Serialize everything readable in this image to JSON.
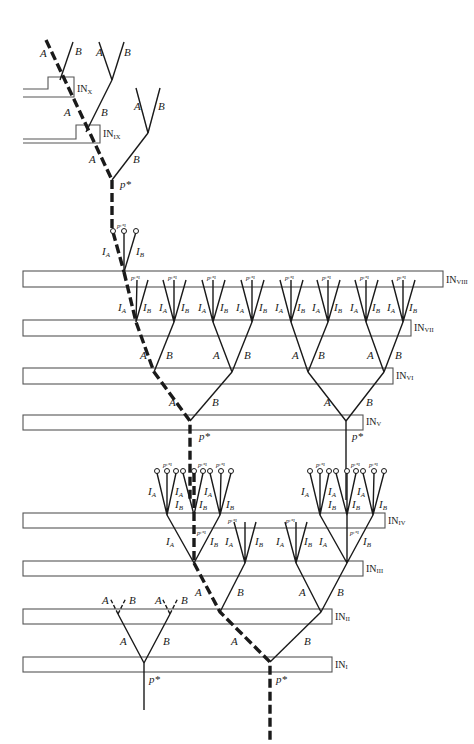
{
  "diagram": {
    "type": "branching-tree-with-interaction-zones",
    "path_style": {
      "highlighted_path": "dashed-thick",
      "other": "solid-thin"
    },
    "branch_labels": {
      "a": "A",
      "b": "B",
      "ia": "I",
      "ia_sub": "A",
      "ib": "I",
      "ib_sub": "B"
    },
    "node_labels": {
      "pstar": "p*",
      "pnext": "pᵗ⁺¹"
    },
    "interaction_zones": [
      {
        "id": "I",
        "label": "IN",
        "sub": "I"
      },
      {
        "id": "II",
        "label": "IN",
        "sub": "II"
      },
      {
        "id": "III",
        "label": "IN",
        "sub": "III"
      },
      {
        "id": "IV",
        "label": "IN",
        "sub": "IV"
      },
      {
        "id": "V",
        "label": "IN",
        "sub": "V"
      },
      {
        "id": "VI",
        "label": "IN",
        "sub": "VI"
      },
      {
        "id": "VII",
        "label": "IN",
        "sub": "VII"
      },
      {
        "id": "VIII",
        "label": "IN",
        "sub": "VIII"
      },
      {
        "id": "IX",
        "label": "IN",
        "sub": "IX"
      },
      {
        "id": "X",
        "label": "IN",
        "sub": "X"
      }
    ]
  }
}
